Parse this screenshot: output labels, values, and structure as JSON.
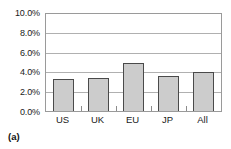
{
  "caption": "(a)",
  "chart_data": {
    "type": "bar",
    "title": "",
    "xlabel": "",
    "ylabel": "",
    "categories": [
      "US",
      "UK",
      "EU",
      "JP",
      "All"
    ],
    "values": [
      3.3,
      3.45,
      5.0,
      3.65,
      4.05
    ],
    "value_format": "percent",
    "ylim": [
      0,
      10
    ],
    "ytick_values": [
      0,
      2,
      4,
      6,
      8,
      10
    ],
    "ytick_labels": [
      "0.0%",
      "2.0%",
      "4.0%",
      "6.0%",
      "8.0%",
      "10.0%"
    ],
    "grid": true,
    "grid_axis": "y",
    "legend": false,
    "legend_position": "none",
    "bar_fill_color": "#cccccc",
    "bar_border_color": "#4a4a4a",
    "plot_border_color": "#9a9a9a",
    "gridline_color": "#b0b0b0",
    "background_color": "#ffffff"
  }
}
